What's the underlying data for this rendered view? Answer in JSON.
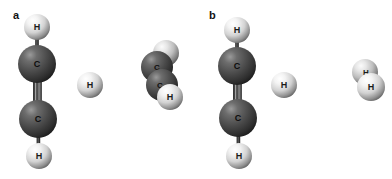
{
  "figure": {
    "background_color": "#ffffff",
    "width": 392,
    "height": 179,
    "panels": [
      {
        "label": "a",
        "label_x": 13,
        "label_y": 10,
        "fragments": [
          {
            "name": "acetylene",
            "formula": "C2H2",
            "bond_order_label": "triple",
            "atoms": [
              {
                "element": "H",
                "label": "H",
                "cx": 37,
                "cy": 27,
                "r": 13,
                "color": "#e8e8e8",
                "label_color": "#1a1a1a",
                "font_size": 9
              },
              {
                "element": "C",
                "label": "C",
                "cx": 37,
                "cy": 64,
                "r": 19,
                "color": "#4a4a4a",
                "label_color": "#111111",
                "font_size": 9
              },
              {
                "element": "C",
                "label": "C",
                "cx": 38,
                "cy": 119,
                "r": 19,
                "color": "#4a4a4a",
                "label_color": "#111111",
                "font_size": 9
              },
              {
                "element": "H",
                "label": "H",
                "cx": 39,
                "cy": 156,
                "r": 13,
                "color": "#e8e8e8",
                "label_color": "#1a1a1a",
                "font_size": 9
              }
            ],
            "bonds": [
              {
                "from": 0,
                "to": 1,
                "order": 1
              },
              {
                "from": 1,
                "to": 2,
                "order": 3
              },
              {
                "from": 2,
                "to": 3,
                "order": 1
              }
            ]
          },
          {
            "name": "free-hydrogen-atom",
            "formula": "H",
            "atoms": [
              {
                "element": "H",
                "label": "H",
                "cx": 90,
                "cy": 85,
                "r": 13,
                "color": "#e8e8e8",
                "label_color": "#1a1a1a",
                "font_size": 9
              }
            ],
            "bonds": []
          },
          {
            "name": "ethynyl-hydrogen-cluster",
            "formula": "C2H",
            "atoms": [
              {
                "element": "H",
                "label": "",
                "cx": 166,
                "cy": 53,
                "r": 13,
                "color": "#dcdcdc",
                "label_color": "#1a1a1a",
                "font_size": 9
              },
              {
                "element": "C",
                "label": "C",
                "cx": 157,
                "cy": 67,
                "r": 16,
                "color": "#4a4a4a",
                "label_color": "#111111",
                "font_size": 8
              },
              {
                "element": "C",
                "label": "C",
                "cx": 162,
                "cy": 85,
                "r": 16,
                "color": "#4a4a4a",
                "label_color": "#111111",
                "font_size": 8
              },
              {
                "element": "H",
                "label": "H",
                "cx": 170,
                "cy": 97,
                "r": 13,
                "color": "#f0f0f0",
                "label_color": "#1a1a1a",
                "font_size": 9
              }
            ],
            "bonds": []
          }
        ]
      },
      {
        "label": "b",
        "label_x": 209,
        "label_y": 10,
        "fragments": [
          {
            "name": "acetylene",
            "formula": "C2H2",
            "bond_order_label": "triple",
            "atoms": [
              {
                "element": "H",
                "label": "H",
                "cx": 237,
                "cy": 30,
                "r": 13,
                "color": "#e8e8e8",
                "label_color": "#1a1a1a",
                "font_size": 9
              },
              {
                "element": "C",
                "label": "C",
                "cx": 237,
                "cy": 66,
                "r": 19,
                "color": "#4a4a4a",
                "label_color": "#111111",
                "font_size": 9
              },
              {
                "element": "C",
                "label": "C",
                "cx": 238,
                "cy": 118,
                "r": 19,
                "color": "#4a4a4a",
                "label_color": "#111111",
                "font_size": 9
              },
              {
                "element": "H",
                "label": "H",
                "cx": 239,
                "cy": 156,
                "r": 13,
                "color": "#e8e8e8",
                "label_color": "#1a1a1a",
                "font_size": 9
              }
            ],
            "bonds": [
              {
                "from": 0,
                "to": 1,
                "order": 1
              },
              {
                "from": 1,
                "to": 2,
                "order": 3
              },
              {
                "from": 2,
                "to": 3,
                "order": 1
              }
            ]
          },
          {
            "name": "free-hydrogen-atom",
            "formula": "H",
            "atoms": [
              {
                "element": "H",
                "label": "H",
                "cx": 284,
                "cy": 85,
                "r": 13,
                "color": "#e8e8e8",
                "label_color": "#1a1a1a",
                "font_size": 9
              }
            ],
            "bonds": []
          },
          {
            "name": "dihydrogen-molecule",
            "formula": "H2",
            "atoms": [
              {
                "element": "H",
                "label": "H",
                "cx": 365,
                "cy": 72,
                "r": 13,
                "color": "#e0e0e0",
                "label_color": "#1a1a1a",
                "font_size": 8
              },
              {
                "element": "H",
                "label": "H",
                "cx": 371,
                "cy": 87,
                "r": 14,
                "color": "#f2f2f2",
                "label_color": "#1a1a1a",
                "font_size": 9
              }
            ],
            "bonds": []
          }
        ]
      }
    ]
  },
  "colors": {
    "carbon": "#4a4a4a",
    "hydrogen": "#e8e8e8",
    "bond": "#2b2b2b",
    "background": "#ffffff",
    "text": "#111111"
  }
}
